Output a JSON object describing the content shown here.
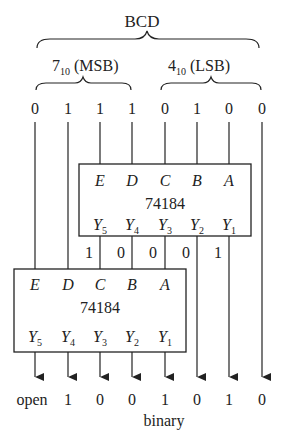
{
  "title": "BCD",
  "groups": [
    {
      "label_main": "7",
      "label_sub": "10",
      "label_tail": " (MSB)"
    },
    {
      "label_main": "4",
      "label_sub": "10",
      "label_tail": " (LSB)"
    }
  ],
  "inputs": [
    "0",
    "1",
    "1",
    "1",
    "0",
    "1",
    "0",
    "0"
  ],
  "chips": [
    {
      "name": "74184",
      "inputs": [
        "E",
        "D",
        "C",
        "B",
        "A"
      ],
      "outputs": [
        {
          "main": "Y",
          "sub": "5"
        },
        {
          "main": "Y",
          "sub": "4"
        },
        {
          "main": "Y",
          "sub": "3"
        },
        {
          "main": "Y",
          "sub": "2"
        },
        {
          "main": "Y",
          "sub": "1"
        }
      ]
    },
    {
      "name": "74184",
      "inputs": [
        "E",
        "D",
        "C",
        "B",
        "A"
      ],
      "outputs": [
        {
          "main": "Y",
          "sub": "5"
        },
        {
          "main": "Y",
          "sub": "4"
        },
        {
          "main": "Y",
          "sub": "3"
        },
        {
          "main": "Y",
          "sub": "2"
        },
        {
          "main": "Y",
          "sub": "1"
        }
      ]
    }
  ],
  "intermediate": [
    "1",
    "0",
    "0",
    "0",
    "1"
  ],
  "outputs": [
    "open",
    "1",
    "0",
    "0",
    "1",
    "0",
    "1",
    "0"
  ],
  "output_label": "binary",
  "colors": {
    "line": "#222222",
    "background": "#ffffff"
  }
}
